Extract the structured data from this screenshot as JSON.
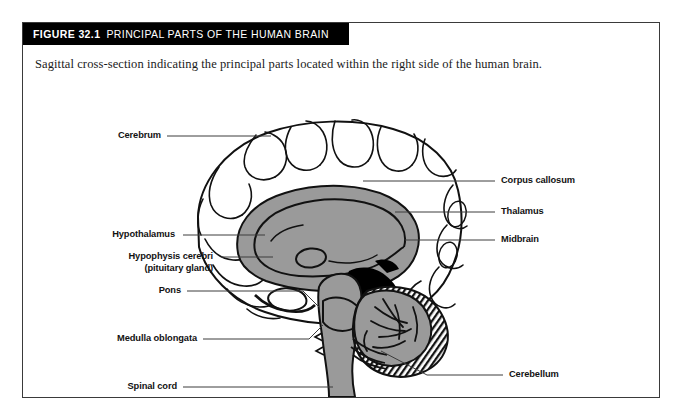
{
  "figure": {
    "number_label": "FIGURE 32.1",
    "title": "PRINCIPAL PARTS OF THE HUMAN BRAIN",
    "caption": "Sagittal cross-section indicating the principal parts located within the right side of the human brain.",
    "header_bg": "#000000",
    "header_text_color": "#ffffff",
    "frame_border_color": "#3a3a3a"
  },
  "diagram": {
    "type": "anatomical-illustration",
    "subject": "human brain sagittal cross-section",
    "colors": {
      "outline": "#111111",
      "gray_matter_fill": "#9a9a9a",
      "cortex_fill": "#ffffff",
      "dark_wedge": "#000000",
      "leader_line": "#3c3c3c"
    },
    "labels_left": [
      {
        "id": "cerebrum",
        "text": "Cerebrum",
        "line2": ""
      },
      {
        "id": "hypothalamus",
        "text": "Hypothalamus",
        "line2": ""
      },
      {
        "id": "hypophysis",
        "text": "Hypophysis cerebri",
        "line2": "(pituitary gland)"
      },
      {
        "id": "pons",
        "text": "Pons",
        "line2": ""
      },
      {
        "id": "medulla",
        "text": "Medulla oblongata",
        "line2": ""
      },
      {
        "id": "spinal-cord",
        "text": "Spinal cord",
        "line2": ""
      }
    ],
    "labels_right": [
      {
        "id": "corpus-callosum",
        "text": "Corpus callosum"
      },
      {
        "id": "thalamus",
        "text": "Thalamus"
      },
      {
        "id": "midbrain",
        "text": "Midbrain"
      },
      {
        "id": "cerebellum",
        "text": "Cerebellum"
      }
    ]
  }
}
